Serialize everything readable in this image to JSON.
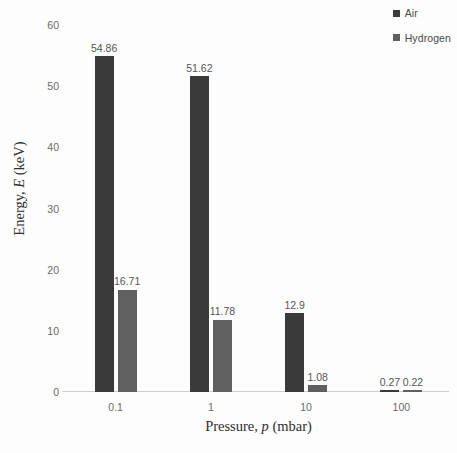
{
  "chart_data": {
    "type": "bar",
    "title": "",
    "subtitle": "",
    "xlabel_parts": {
      "pre": "Pressure, ",
      "sym": "p",
      "post": " (mbar)"
    },
    "ylabel_parts": {
      "pre": "Energy, ",
      "sym": "E",
      "post": " (keV)"
    },
    "xlabel": "Pressure, p (mbar)",
    "ylabel": "Energy, E (keV)",
    "categories": [
      "0.1",
      "1",
      "10",
      "100"
    ],
    "series": [
      {
        "name": "Air",
        "color": "#3a3a3a",
        "values": [
          54.86,
          51.62,
          12.9,
          0.27
        ],
        "labels": [
          "54.86",
          "51.62",
          "12.9",
          "0.27"
        ]
      },
      {
        "name": "Hydrogen",
        "color": "#5f5f5f",
        "values": [
          16.71,
          11.78,
          1.08,
          0.22
        ],
        "labels": [
          "16.71",
          "11.78",
          "1.08",
          "0.22"
        ]
      }
    ],
    "ylim": [
      0,
      60
    ],
    "yticks": [
      0,
      10,
      20,
      30,
      40,
      50,
      60
    ],
    "ytick_labels": [
      "0",
      "10",
      "20",
      "30",
      "40",
      "50",
      "60"
    ],
    "grid": false,
    "legend_position": "top-right",
    "axis_color": "#cfcfcf",
    "label_color": "#6a6a6a",
    "background": "#fdfdfd"
  },
  "legend": {
    "items": [
      {
        "label": "Air",
        "color": "#3a3a3a"
      },
      {
        "label": "Hydrogen",
        "color": "#5f5f5f"
      }
    ]
  }
}
